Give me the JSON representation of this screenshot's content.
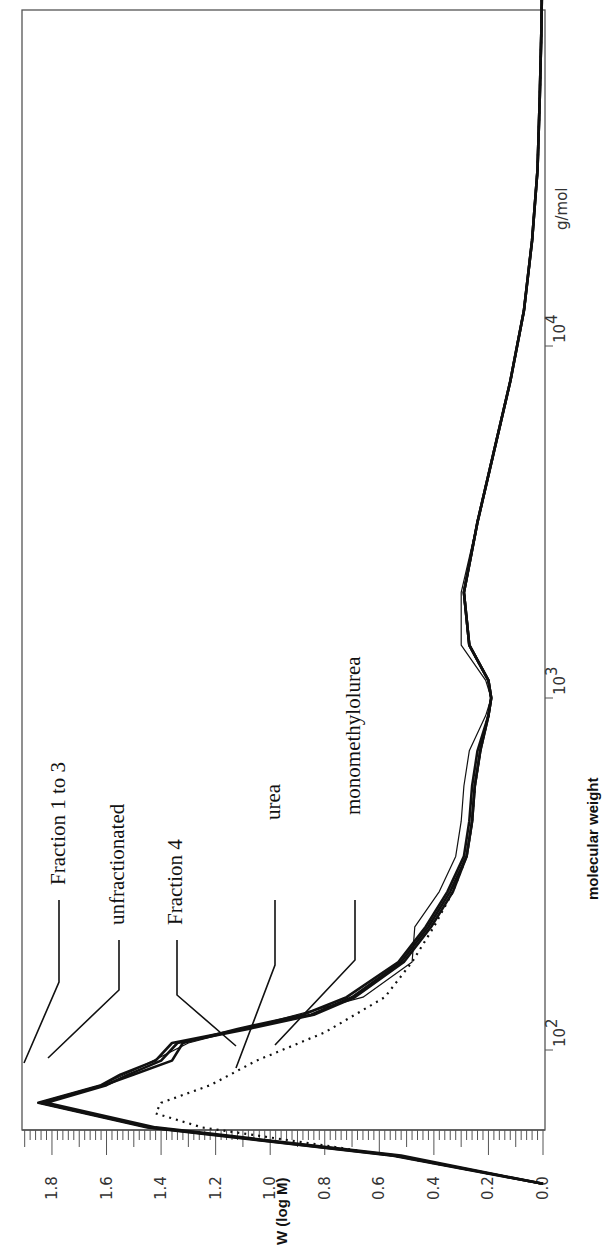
{
  "chart_data": {
    "type": "line",
    "orientation": "rotated-90-ccw",
    "title": "",
    "xlabel": "molecular weight",
    "x_unit": "g/mol",
    "x_scale": "log",
    "x_ticks": [
      "10^2",
      "10^3",
      "10^4"
    ],
    "x_tick_labels": [
      {
        "base": "10",
        "exp": "2"
      },
      {
        "base": "10",
        "exp": "3"
      },
      {
        "base": "10",
        "exp": "4"
      }
    ],
    "xlim_log10": [
      1.6,
      5.07
    ],
    "ylabel": "W (log M)",
    "ylim": [
      0.0,
      1.9
    ],
    "y_ticks": [
      "1.8",
      "1.6",
      "1.4",
      "1.2",
      "1.0",
      "0.8",
      "0.6",
      "0.4",
      "0.2",
      "0.0"
    ],
    "grid": false,
    "series": [
      {
        "name": "Fraction 1 to 3",
        "style": "solid",
        "x_log10": [
          1.62,
          1.7,
          1.78,
          1.85,
          1.9,
          1.93,
          1.97,
          2.02,
          2.06,
          2.1,
          2.15,
          2.25,
          2.35,
          2.45,
          2.55,
          2.65,
          2.75,
          2.85,
          2.95,
          3.0,
          3.05,
          3.15,
          3.3,
          3.5,
          3.7,
          3.9,
          4.1,
          4.3,
          4.5,
          4.7,
          4.9,
          5.07
        ],
        "y": [
          0.0,
          0.55,
          1.45,
          1.85,
          1.62,
          1.55,
          1.42,
          1.36,
          1.1,
          0.85,
          0.7,
          0.52,
          0.42,
          0.34,
          0.28,
          0.26,
          0.25,
          0.23,
          0.2,
          0.19,
          0.2,
          0.27,
          0.29,
          0.24,
          0.18,
          0.12,
          0.07,
          0.04,
          0.02,
          0.012,
          0.006,
          0.003
        ]
      },
      {
        "name": "unfractionated",
        "style": "solid",
        "x_log10": [
          1.62,
          1.7,
          1.78,
          1.85,
          1.9,
          1.93,
          1.97,
          2.02,
          2.06,
          2.1,
          2.15,
          2.25,
          2.35,
          2.45,
          2.55,
          2.65,
          2.75,
          2.85,
          2.95,
          3.0,
          3.05,
          3.15,
          3.3,
          3.5,
          3.7,
          3.9,
          4.1,
          4.3,
          4.5,
          4.7,
          4.9,
          5.07
        ],
        "y": [
          0.0,
          0.52,
          1.42,
          1.82,
          1.6,
          1.52,
          1.4,
          1.34,
          1.08,
          0.84,
          0.69,
          0.51,
          0.41,
          0.33,
          0.28,
          0.26,
          0.25,
          0.23,
          0.2,
          0.19,
          0.2,
          0.27,
          0.29,
          0.24,
          0.18,
          0.12,
          0.07,
          0.04,
          0.02,
          0.012,
          0.006,
          0.003
        ]
      },
      {
        "name": "Fraction 4",
        "style": "solid",
        "x_log10": [
          1.62,
          1.7,
          1.78,
          1.85,
          1.9,
          1.93,
          1.97,
          2.02,
          2.06,
          2.1,
          2.15,
          2.25,
          2.35,
          2.45,
          2.55,
          2.65,
          2.75,
          2.85,
          2.95,
          3.0,
          3.05,
          3.15,
          3.3,
          3.5,
          3.7,
          3.9,
          4.1,
          4.3,
          4.5,
          4.7,
          4.9,
          5.07
        ],
        "y": [
          0.0,
          0.54,
          1.44,
          1.84,
          1.61,
          1.5,
          1.36,
          1.32,
          1.12,
          0.88,
          0.72,
          0.53,
          0.43,
          0.35,
          0.29,
          0.27,
          0.26,
          0.24,
          0.2,
          0.19,
          0.2,
          0.27,
          0.29,
          0.24,
          0.18,
          0.12,
          0.07,
          0.04,
          0.02,
          0.012,
          0.006,
          0.003
        ]
      },
      {
        "name": "urea",
        "style": "dotted",
        "x_log10": [
          1.62,
          1.7,
          1.78,
          1.82,
          1.85,
          1.9,
          1.97,
          2.05,
          2.15,
          2.25,
          2.35,
          2.45,
          2.55,
          2.65,
          2.75,
          2.85,
          2.95,
          3.0,
          3.05,
          3.15,
          3.3,
          3.5,
          3.7,
          3.9,
          4.1,
          4.3,
          4.5,
          4.7,
          4.9,
          5.07
        ],
        "y": [
          0.0,
          0.55,
          1.25,
          1.42,
          1.4,
          1.22,
          1.05,
          0.8,
          0.58,
          0.48,
          0.4,
          0.33,
          0.28,
          0.26,
          0.25,
          0.23,
          0.2,
          0.19,
          0.2,
          0.27,
          0.29,
          0.24,
          0.18,
          0.12,
          0.07,
          0.04,
          0.02,
          0.012,
          0.006,
          0.003
        ]
      },
      {
        "name": "monomethylolurea",
        "style": "thin-solid",
        "x_log10": [
          1.62,
          1.7,
          1.78,
          1.85,
          1.9,
          1.95,
          2.02,
          2.08,
          2.15,
          2.25,
          2.35,
          2.45,
          2.55,
          2.65,
          2.75,
          2.85,
          2.95,
          3.0,
          3.05,
          3.15,
          3.3,
          3.5,
          3.7,
          3.9,
          4.1,
          4.3,
          4.5,
          4.7,
          4.9,
          5.07
        ],
        "y": [
          0.0,
          0.55,
          1.45,
          1.85,
          1.62,
          1.48,
          1.3,
          1.0,
          0.66,
          0.48,
          0.47,
          0.38,
          0.32,
          0.3,
          0.29,
          0.27,
          0.21,
          0.19,
          0.21,
          0.3,
          0.3,
          0.24,
          0.18,
          0.12,
          0.07,
          0.04,
          0.02,
          0.012,
          0.006,
          0.003
        ]
      }
    ],
    "annotations": [
      {
        "text": "Fraction 1 to 3",
        "points_to": "peak at ~1.85"
      },
      {
        "text": "unfractionated",
        "points_to": "peak at ~1.82"
      },
      {
        "text": "Fraction 4",
        "points_to": "shoulder ~1.4"
      },
      {
        "text": "urea",
        "points_to": "dotted peak ~1.42"
      },
      {
        "text": "monomethylolurea",
        "points_to": "thin curve ~1.0"
      }
    ],
    "legend_position": "inline-callouts"
  },
  "axes": {
    "y_title": "W (log M)",
    "x_title": "molecular weight",
    "x_unit": "g/mol",
    "y_tick_labels": [
      "1.8",
      "1.6",
      "1.4",
      "1.2",
      "1.0",
      "0.8",
      "0.6",
      "0.4",
      "0.2",
      "0.0"
    ],
    "x_tick_base": "10",
    "x_tick_exps": [
      "2",
      "3",
      "4"
    ]
  },
  "labels": {
    "fraction13": "Fraction 1 to 3",
    "unfractionated": "unfractionated",
    "fraction4": "Fraction 4",
    "urea": "urea",
    "mmu": "monomethylolurea"
  }
}
